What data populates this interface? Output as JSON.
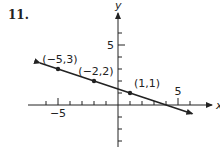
{
  "problem_number": "11.",
  "chart_data": {
    "type": "line",
    "title": "",
    "xlabel": "x",
    "ylabel": "y",
    "xlim": [
      -7.5,
      7.5
    ],
    "ylim": [
      -5,
      7.5
    ],
    "x_ticks": [
      -6,
      -5,
      -4,
      -3,
      -2,
      -1,
      1,
      2,
      3,
      4,
      5,
      6
    ],
    "y_ticks": [
      -4,
      -3,
      -2,
      -1,
      1,
      2,
      3,
      4,
      5,
      6
    ],
    "x_tick_labels": [
      {
        "value": -5,
        "label": "−5"
      },
      {
        "value": 5,
        "label": "5"
      }
    ],
    "y_tick_labels": [
      {
        "value": 5,
        "label": "5"
      }
    ],
    "grid": false,
    "line": {
      "slope": -0.3333,
      "intercept": 1.3333,
      "x_range": [
        -6.5,
        6.2
      ],
      "arrows": "both"
    },
    "points": [
      {
        "x": -5,
        "y": 3,
        "label": "(−5,3)"
      },
      {
        "x": -2,
        "y": 2,
        "label": "(−2,2)"
      },
      {
        "x": 1,
        "y": 1,
        "label": "(1,1)"
      }
    ],
    "color": "#222222"
  }
}
